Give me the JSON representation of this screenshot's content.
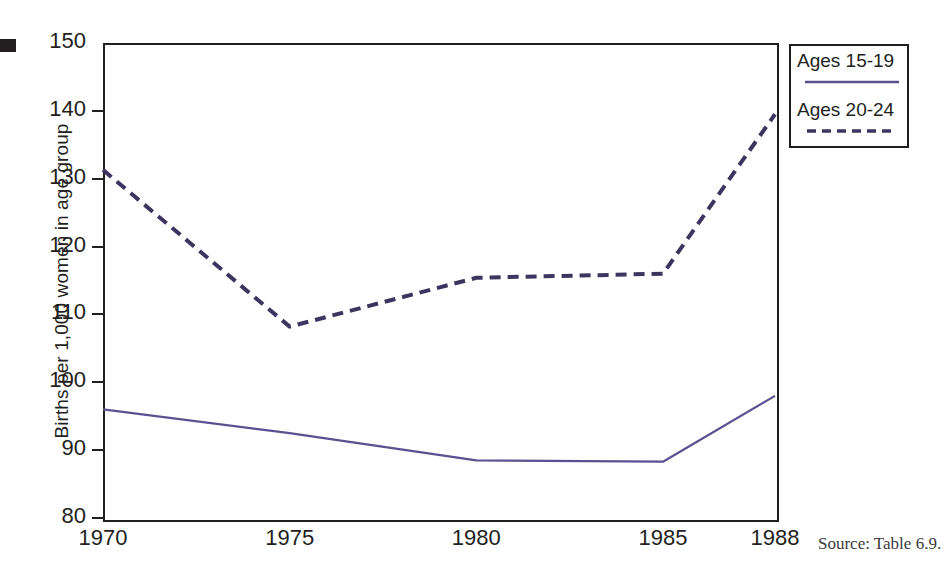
{
  "figure": {
    "source_note": "Source: Table 6.9.",
    "edge_mark_name": "page-edge-mark"
  },
  "chart_data": {
    "type": "line",
    "title": "",
    "xlabel": "",
    "ylabel": "Births per 1,000 women in age group",
    "categories": [
      "1970",
      "1975",
      "1980",
      "1985",
      "1988"
    ],
    "x_positions": [
      1970,
      1975,
      1980,
      1985,
      1988
    ],
    "xlim": [
      1970,
      1988
    ],
    "ylim": [
      80,
      150
    ],
    "y_ticks": [
      80,
      90,
      100,
      110,
      120,
      130,
      140,
      150
    ],
    "grid": false,
    "legend_position": "top-right-outside",
    "series": [
      {
        "name": "Ages 15-19",
        "style": "solid",
        "color": "#5b5191",
        "values": [
          96.0,
          92.5,
          88.5,
          88.3,
          98.0
        ]
      },
      {
        "name": "Ages 20-24",
        "style": "dashed",
        "color": "#3d3560",
        "values": [
          131.3,
          108.2,
          115.4,
          116.0,
          139.5
        ]
      }
    ]
  },
  "legend": {
    "entries": [
      {
        "label": "Ages 15-19",
        "style": "solid",
        "color": "#5b5191"
      },
      {
        "label": "Ages 20-24",
        "style": "dashed",
        "color": "#3d3560"
      }
    ]
  }
}
